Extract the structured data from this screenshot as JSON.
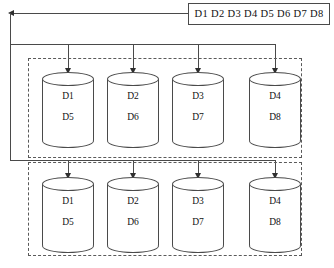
{
  "diagram": {
    "source": {
      "label": "D1 D2 D3 D4 D5 D6 D7 D8",
      "blocks": [
        "D1",
        "D2",
        "D3",
        "D4",
        "D5",
        "D6",
        "D7",
        "D8"
      ]
    },
    "groups": [
      {
        "id": "primary",
        "name": "primary-storage-group",
        "nodes": [
          {
            "id": "p1",
            "top_label": "D1",
            "bottom_label": "D5"
          },
          {
            "id": "p2",
            "top_label": "D2",
            "bottom_label": "D6"
          },
          {
            "id": "p3",
            "top_label": "D3",
            "bottom_label": "D7"
          },
          {
            "id": "p4",
            "top_label": "D4",
            "bottom_label": "D8"
          }
        ]
      },
      {
        "id": "replica",
        "name": "replica-storage-group",
        "nodes": [
          {
            "id": "r1",
            "top_label": "D1",
            "bottom_label": "D5"
          },
          {
            "id": "r2",
            "top_label": "D2",
            "bottom_label": "D6"
          },
          {
            "id": "r3",
            "top_label": "D3",
            "bottom_label": "D7"
          },
          {
            "id": "r4",
            "top_label": "D4",
            "bottom_label": "D8"
          }
        ]
      }
    ],
    "colors": {
      "stroke": "#4a4a4a",
      "arrow": "#2f2f2f",
      "text": "#111111",
      "background": "#ffffff",
      "dashed_border": "#5a5a5a"
    }
  }
}
